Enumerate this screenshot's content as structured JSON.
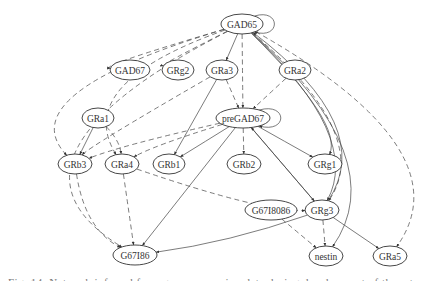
{
  "diagram": {
    "type": "directed-graph",
    "nodes": [
      {
        "id": "GAD65",
        "label": "GAD65",
        "x": 242,
        "y": 24,
        "rx": 21,
        "ry": 10
      },
      {
        "id": "GAD67",
        "label": "GAD67",
        "x": 130,
        "y": 70,
        "rx": 20,
        "ry": 10
      },
      {
        "id": "GRg2",
        "label": "GRg2",
        "x": 178,
        "y": 70,
        "rx": 16,
        "ry": 10
      },
      {
        "id": "GRa3",
        "label": "GRa3",
        "x": 222,
        "y": 70,
        "rx": 16,
        "ry": 10
      },
      {
        "id": "GRa2",
        "label": "GRa2",
        "x": 295,
        "y": 70,
        "rx": 16,
        "ry": 10
      },
      {
        "id": "GRa1",
        "label": "GRa1",
        "x": 98,
        "y": 118,
        "rx": 16,
        "ry": 10
      },
      {
        "id": "preGAD67",
        "label": "preGAD67",
        "x": 243,
        "y": 118,
        "rx": 27,
        "ry": 10
      },
      {
        "id": "GRb3",
        "label": "GRb3",
        "x": 75,
        "y": 164,
        "rx": 17,
        "ry": 10
      },
      {
        "id": "GRa4",
        "label": "GRa4",
        "x": 122,
        "y": 164,
        "rx": 17,
        "ry": 10
      },
      {
        "id": "GRb1",
        "label": "GRb1",
        "x": 169,
        "y": 164,
        "rx": 16,
        "ry": 10
      },
      {
        "id": "GRb2",
        "label": "GRb2",
        "x": 244,
        "y": 164,
        "rx": 17,
        "ry": 10
      },
      {
        "id": "GRg1",
        "label": "GRg1",
        "x": 325,
        "y": 164,
        "rx": 17,
        "ry": 10
      },
      {
        "id": "G67I8086",
        "label": "G67I8086",
        "x": 271,
        "y": 210,
        "rx": 26,
        "ry": 10
      },
      {
        "id": "GRg3",
        "label": "GRg3",
        "x": 322,
        "y": 210,
        "rx": 17,
        "ry": 10
      },
      {
        "id": "G67I86",
        "label": "G67I86",
        "x": 135,
        "y": 255,
        "rx": 22,
        "ry": 10
      },
      {
        "id": "nestin",
        "label": "nestin",
        "x": 326,
        "y": 256,
        "rx": 17,
        "ry": 10
      },
      {
        "id": "GRa5",
        "label": "GRa5",
        "x": 390,
        "y": 256,
        "rx": 17,
        "ry": 10
      }
    ],
    "edges": [
      {
        "from": "GAD65",
        "to": "GAD65",
        "style": "solid",
        "self_loop": true
      },
      {
        "from": "GAD65",
        "to": "GAD67",
        "style": "dashed"
      },
      {
        "from": "GAD65",
        "to": "GRg2",
        "style": "dashed"
      },
      {
        "from": "GAD65",
        "to": "GRa3",
        "style": "solid"
      },
      {
        "from": "GAD65",
        "to": "preGAD67",
        "style": "dashed"
      },
      {
        "from": "GAD65",
        "to": "GRb3",
        "style": "dashed"
      },
      {
        "from": "GAD65",
        "to": "GRa4",
        "style": "dashed"
      },
      {
        "from": "GAD65",
        "to": "G67I86",
        "style": "dashed"
      },
      {
        "from": "GAD65",
        "to": "GRg1",
        "style": "solid"
      },
      {
        "from": "GAD65",
        "to": "GRg3",
        "style": "solid"
      },
      {
        "from": "GAD65",
        "to": "GRg3",
        "style": "dashed"
      },
      {
        "from": "GAD65",
        "to": "nestin",
        "style": "solid"
      },
      {
        "from": "GAD65",
        "to": "GRa5",
        "style": "dashed"
      },
      {
        "from": "GRg3",
        "to": "GAD65",
        "style": "solid"
      },
      {
        "from": "GRa3",
        "to": "preGAD67",
        "style": "dashed"
      },
      {
        "from": "GRa3",
        "to": "GRb1",
        "style": "solid"
      },
      {
        "from": "GRa3",
        "to": "GRb3",
        "style": "dashed"
      },
      {
        "from": "GRa2",
        "to": "preGAD67",
        "style": "dashed"
      },
      {
        "from": "preGAD67",
        "to": "preGAD67",
        "style": "solid",
        "self_loop": true
      },
      {
        "from": "preGAD67",
        "to": "GRb3",
        "style": "dashed"
      },
      {
        "from": "preGAD67",
        "to": "GRa4",
        "style": "dashed"
      },
      {
        "from": "preGAD67",
        "to": "GRb1",
        "style": "solid"
      },
      {
        "from": "preGAD67",
        "to": "GRb2",
        "style": "dashed"
      },
      {
        "from": "preGAD67",
        "to": "GRg1",
        "style": "solid"
      },
      {
        "from": "preGAD67",
        "to": "GRg3",
        "style": "solid"
      },
      {
        "from": "GRg3",
        "to": "preGAD67",
        "style": "solid"
      },
      {
        "from": "preGAD67",
        "to": "G67I86",
        "style": "solid"
      },
      {
        "from": "GRa1",
        "to": "GRb3",
        "style": "solid"
      },
      {
        "from": "GRa1",
        "to": "GRa4",
        "style": "dashed"
      },
      {
        "from": "GRa4",
        "to": "G67I86",
        "style": "dashed"
      },
      {
        "from": "GRa4",
        "to": "GRg3",
        "style": "dashed"
      },
      {
        "from": "GRb3",
        "to": "G67I86",
        "style": "dashed"
      },
      {
        "from": "GRg3",
        "to": "G67I86",
        "style": "solid"
      },
      {
        "from": "GRg3",
        "to": "nestin",
        "style": "dashed"
      },
      {
        "from": "GRg3",
        "to": "GRa5",
        "style": "solid"
      },
      {
        "from": "G67I8086",
        "to": "nestin",
        "style": "dashed"
      }
    ]
  },
  "caption": {
    "text": "Fig. 14. Network inferred from gene expression data during development of the rat cortex. Each node represents a gene"
  }
}
